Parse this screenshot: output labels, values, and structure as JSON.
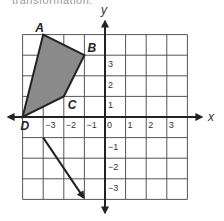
{
  "top_cutoff_text": "transformation.",
  "grid": {
    "x_min": -4,
    "x_max": 4,
    "y_min": -4,
    "y_max": 4,
    "origin_px": [
      105,
      117
    ],
    "unit_px": 20.6
  },
  "axes": {
    "x_label": "x",
    "y_label": "y",
    "x_ticks": [
      "-3",
      "-2",
      "-1",
      "0",
      "1",
      "2",
      "3"
    ],
    "y_ticks_pos": [
      "3",
      "2",
      "1"
    ],
    "y_ticks_neg": [
      "-1",
      "-2",
      "-3"
    ]
  },
  "polygon": {
    "fill": "#8a8a8a",
    "stroke": "#222222",
    "vertices": [
      {
        "label": "A",
        "x": -3,
        "y": 4
      },
      {
        "label": "B",
        "x": -1,
        "y": 3
      },
      {
        "label": "C",
        "x": -2,
        "y": 1
      },
      {
        "label": "D",
        "x": -4,
        "y": 0
      }
    ]
  },
  "translation_vector": {
    "from": {
      "x": -3,
      "y": -1
    },
    "to": {
      "x": -1,
      "y": -4
    }
  }
}
